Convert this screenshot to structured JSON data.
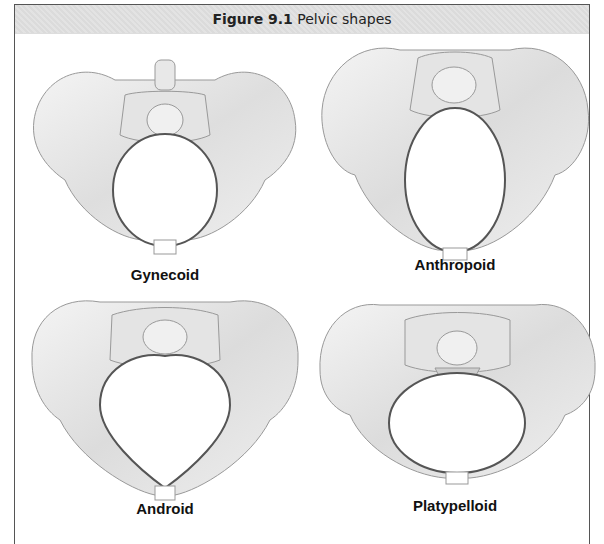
{
  "figure": {
    "number_label": "Figure 9.1",
    "title": "Pelvic shapes"
  },
  "panels": [
    {
      "label": "Gynecoid",
      "inlet_shape": "round"
    },
    {
      "label": "Anthropoid",
      "inlet_shape": "oval-vertical"
    },
    {
      "label": "Android",
      "inlet_shape": "heart"
    },
    {
      "label": "Platypelloid",
      "inlet_shape": "oval-horizontal"
    }
  ],
  "colors": {
    "bone": "#ececec",
    "bone_shade": "#d6d6d6",
    "outline": "#8a8a8a",
    "inlet_outline": "#555555",
    "title_bg": "#e2e2e2"
  }
}
